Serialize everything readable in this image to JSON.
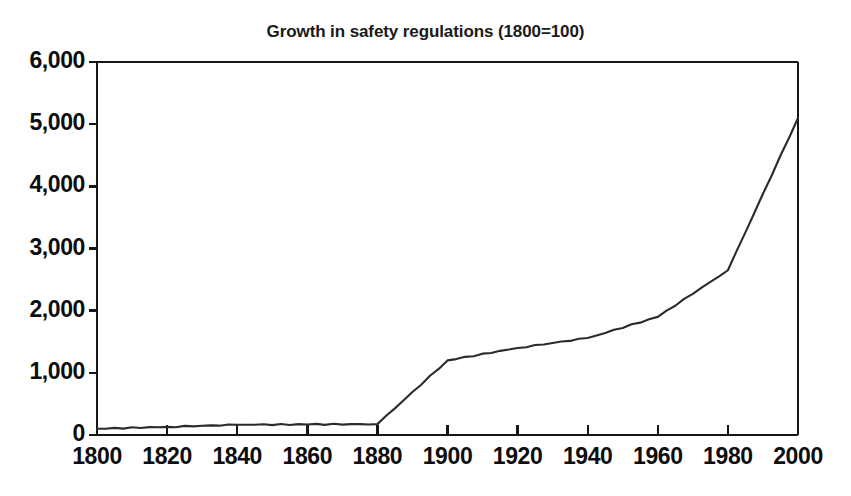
{
  "chart_data": {
    "type": "line",
    "title": "Growth in safety regulations (1800=100)",
    "xlabel": "",
    "ylabel": "",
    "x": [
      1800,
      1820,
      1840,
      1860,
      1880,
      1900,
      1920,
      1940,
      1960,
      1980,
      2000
    ],
    "values": [
      100,
      130,
      165,
      170,
      175,
      1200,
      1400,
      1560,
      1900,
      2650,
      5100
    ],
    "series": [
      {
        "name": "Growth in safety regulations (1800=100)",
        "values": [
          100,
          130,
          165,
          170,
          175,
          1200,
          1400,
          1560,
          1900,
          2650,
          5100
        ]
      }
    ],
    "xlim": [
      1800,
      2000
    ],
    "ylim": [
      0,
      6000
    ],
    "xticks": [
      1800,
      1820,
      1840,
      1860,
      1880,
      1900,
      1920,
      1940,
      1960,
      1980,
      2000
    ],
    "yticks": [
      0,
      1000,
      2000,
      3000,
      4000,
      5000,
      6000
    ],
    "xtick_labels": [
      "1800",
      "1820",
      "1840",
      "1860",
      "1880",
      "1900",
      "1920",
      "1940",
      "1960",
      "1980",
      "2000"
    ],
    "ytick_labels": [
      "0",
      "1,000",
      "2,000",
      "3,000",
      "4,000",
      "5,000",
      "6,000"
    ],
    "grid": false,
    "legend": false,
    "line_color": "#2b2b2b",
    "background_color": "#ffffff",
    "axis_color": "#161616"
  }
}
